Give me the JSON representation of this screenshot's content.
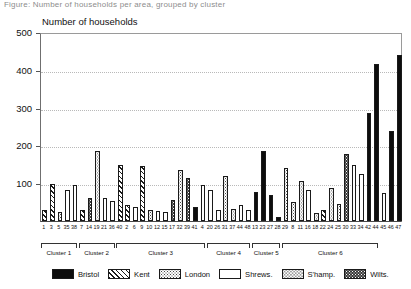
{
  "figure": {
    "caption_faint": "Figure: Number of households per area, grouped by cluster",
    "y_axis_title": "Number of households",
    "x_axis_title": ""
  },
  "axis": {
    "yticks": [
      0,
      100,
      200,
      300,
      400,
      500
    ],
    "ylabels": [
      "",
      "100",
      "200",
      "300",
      "400",
      "500"
    ],
    "ymin": 0,
    "ymax": 500
  },
  "legend": {
    "items": [
      {
        "label": "Bristol",
        "pattern": "solid-black",
        "class": "p-bristol"
      },
      {
        "label": "Kent",
        "pattern": "diagonal-hatch",
        "class": "p-kent"
      },
      {
        "label": "London",
        "pattern": "dark-stipple",
        "class": "p-london"
      },
      {
        "label": "Shrews.",
        "pattern": "blank-white",
        "class": "p-shrews"
      },
      {
        "label": "S'hamp.",
        "pattern": "light-stipple",
        "class": "p-shamp"
      },
      {
        "label": "Wilts.",
        "pattern": "dark-crosshatch",
        "class": "p-wilts"
      }
    ]
  },
  "clusters": [
    {
      "label": "Cluster 1",
      "start": 0,
      "count": 5
    },
    {
      "label": "Cluster 2",
      "start": 5,
      "count": 5
    },
    {
      "label": "Cluster 3",
      "start": 10,
      "count": 12
    },
    {
      "label": "Cluster 4",
      "start": 22,
      "count": 6
    },
    {
      "label": "Cluster 5",
      "start": 28,
      "count": 4
    },
    {
      "label": "Cluster 6",
      "start": 32,
      "count": 13
    }
  ],
  "chart_data": {
    "type": "bar",
    "title": "",
    "xlabel": "",
    "ylabel": "Number of households",
    "ylim": [
      0,
      500
    ],
    "grid": true,
    "legend_position": "bottom",
    "categories": [
      "1",
      "3",
      "5",
      "35",
      "38",
      "7",
      "14",
      "19",
      "21",
      "36",
      "40",
      "2",
      "6",
      "9",
      "10",
      "12",
      "15",
      "17",
      "32",
      "39",
      "41",
      "4",
      "20",
      "26",
      "31",
      "37",
      "44",
      "48",
      "13",
      "23",
      "27",
      "28",
      "29",
      "8",
      "11",
      "16",
      "18",
      "22",
      "24",
      "25",
      "30",
      "33",
      "34",
      "42",
      "44",
      "45",
      "46",
      "47"
    ],
    "groups": [
      "Bristol",
      "Kent",
      "London",
      "Shrews.",
      "S'hamp.",
      "Wilts."
    ],
    "bars": [
      {
        "x": "1",
        "value": 30,
        "group": "Kent",
        "cluster": "Cluster 1"
      },
      {
        "x": "3",
        "value": 98,
        "group": "Kent",
        "cluster": "Cluster 1"
      },
      {
        "x": "5",
        "value": 25,
        "group": "London",
        "cluster": "Cluster 1"
      },
      {
        "x": "35",
        "value": 82,
        "group": "Shrews.",
        "cluster": "Cluster 1"
      },
      {
        "x": "38",
        "value": 96,
        "group": "Shrews.",
        "cluster": "Cluster 1"
      },
      {
        "x": "7",
        "value": 28,
        "group": "Kent",
        "cluster": "Cluster 2"
      },
      {
        "x": "14",
        "value": 60,
        "group": "Wilts.",
        "cluster": "Cluster 2"
      },
      {
        "x": "19",
        "value": 185,
        "group": "S'hamp.",
        "cluster": "Cluster 2"
      },
      {
        "x": "21",
        "value": 62,
        "group": "Shrews.",
        "cluster": "Cluster 2"
      },
      {
        "x": "36",
        "value": 52,
        "group": "Shrews.",
        "cluster": "Cluster 2"
      },
      {
        "x": "40",
        "value": 148,
        "group": "Kent",
        "cluster": "Cluster 3"
      },
      {
        "x": "2",
        "value": 42,
        "group": "Kent",
        "cluster": "Cluster 3"
      },
      {
        "x": "6",
        "value": 37,
        "group": "Shrews.",
        "cluster": "Cluster 3"
      },
      {
        "x": "9",
        "value": 145,
        "group": "Kent",
        "cluster": "Cluster 3"
      },
      {
        "x": "10",
        "value": 28,
        "group": "London",
        "cluster": "Cluster 3"
      },
      {
        "x": "12",
        "value": 26,
        "group": "Shrews.",
        "cluster": "Cluster 3"
      },
      {
        "x": "15",
        "value": 24,
        "group": "Shrews.",
        "cluster": "Cluster 3"
      },
      {
        "x": "17",
        "value": 55,
        "group": "Wilts.",
        "cluster": "Cluster 3"
      },
      {
        "x": "32",
        "value": 135,
        "group": "London",
        "cluster": "Cluster 3"
      },
      {
        "x": "39",
        "value": 115,
        "group": "Wilts.",
        "cluster": "Cluster 3"
      },
      {
        "x": "41",
        "value": 38,
        "group": "Bristol",
        "cluster": "Cluster 3"
      },
      {
        "x": "4",
        "value": 95,
        "group": "Shrews.",
        "cluster": "Cluster 3"
      },
      {
        "x": "20",
        "value": 82,
        "group": "Shrews.",
        "cluster": "Cluster 4"
      },
      {
        "x": "26",
        "value": 28,
        "group": "Shrews.",
        "cluster": "Cluster 4"
      },
      {
        "x": "31",
        "value": 118,
        "group": "London",
        "cluster": "Cluster 4"
      },
      {
        "x": "37",
        "value": 32,
        "group": "S'hamp.",
        "cluster": "Cluster 4"
      },
      {
        "x": "44",
        "value": 42,
        "group": "Shrews.",
        "cluster": "Cluster 4"
      },
      {
        "x": "48",
        "value": 30,
        "group": "Shrews.",
        "cluster": "Cluster 4"
      },
      {
        "x": "13",
        "value": 78,
        "group": "Bristol",
        "cluster": "Cluster 5"
      },
      {
        "x": "23",
        "value": 185,
        "group": "Bristol",
        "cluster": "Cluster 5"
      },
      {
        "x": "27",
        "value": 68,
        "group": "Bristol",
        "cluster": "Cluster 5"
      },
      {
        "x": "28",
        "value": 10,
        "group": "Bristol",
        "cluster": "Cluster 5"
      },
      {
        "x": "29",
        "value": 140,
        "group": "London",
        "cluster": "Cluster 6"
      },
      {
        "x": "8",
        "value": 50,
        "group": "London",
        "cluster": "Cluster 6"
      },
      {
        "x": "11",
        "value": 105,
        "group": "S'hamp.",
        "cluster": "Cluster 6"
      },
      {
        "x": "16",
        "value": 82,
        "group": "Shrews.",
        "cluster": "Cluster 6"
      },
      {
        "x": "18",
        "value": 22,
        "group": "S'hamp.",
        "cluster": "Cluster 6"
      },
      {
        "x": "22",
        "value": 30,
        "group": "Kent",
        "cluster": "Cluster 6"
      },
      {
        "x": "24",
        "value": 88,
        "group": "S'hamp.",
        "cluster": "Cluster 6"
      },
      {
        "x": "25",
        "value": 45,
        "group": "London",
        "cluster": "Cluster 6"
      },
      {
        "x": "30",
        "value": 178,
        "group": "Wilts.",
        "cluster": "Cluster 6"
      },
      {
        "x": "33",
        "value": 148,
        "group": "Shrews.",
        "cluster": "Cluster 6"
      },
      {
        "x": "34",
        "value": 125,
        "group": "Shrews.",
        "cluster": "Cluster 6"
      },
      {
        "x": "42",
        "value": 285,
        "group": "Bristol",
        "cluster": "Cluster 6"
      },
      {
        "x": "44",
        "value": 415,
        "group": "Bristol",
        "cluster": "Cluster 6"
      },
      {
        "x": "45",
        "value": 75,
        "group": "Shrews.",
        "cluster": "Cluster 6"
      },
      {
        "x": "46",
        "value": 238,
        "group": "Bristol",
        "cluster": "Cluster 6"
      },
      {
        "x": "47",
        "value": 440,
        "group": "Bristol",
        "cluster": "Cluster 6"
      }
    ]
  }
}
